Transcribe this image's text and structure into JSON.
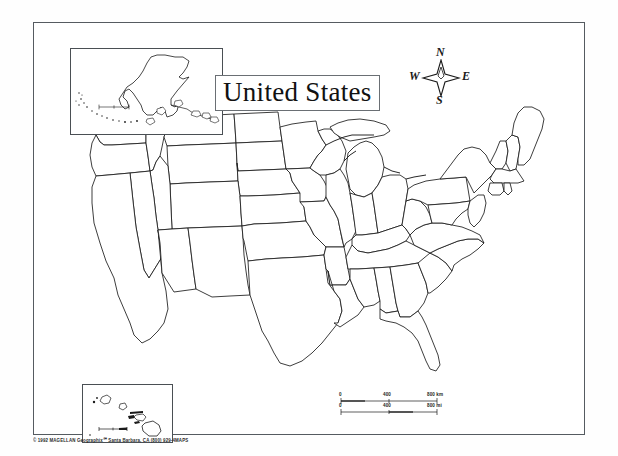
{
  "page": {
    "kind": "blank outline map",
    "background_color": "#ffffff",
    "line_color": "#1b1b1b",
    "frame_color": "#555b60"
  },
  "title": {
    "text": "United States",
    "boxed": true
  },
  "compass": {
    "name": "compass-rose",
    "north_label": "N",
    "south_label": "S",
    "east_label": "E",
    "west_label": "W"
  },
  "insets": [
    {
      "name": "alaska-inset",
      "region": "Alaska",
      "has_scale_bar": true
    },
    {
      "name": "hawaii-inset",
      "region": "Hawaii",
      "has_scale_bar": true
    }
  ],
  "scale_bar": {
    "km": {
      "start": "0",
      "mid": "400",
      "end": "800 km"
    },
    "mi": {
      "start": "0",
      "mid": "400",
      "end": "800 mi"
    }
  },
  "copyright": {
    "text": "© 1992 MAGELLAN Geographix℠  Santa Barbara, CA (800) 929-4MAPS"
  },
  "map": {
    "name": "united-states-outline-map",
    "projection_note": "contiguous United States with state boundaries, no labels",
    "state_count": 48
  }
}
